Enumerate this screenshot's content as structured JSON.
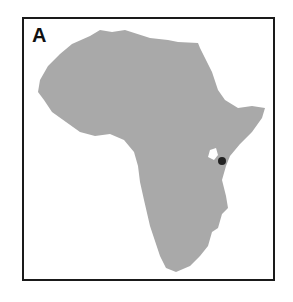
{
  "panel": {
    "label": "A"
  },
  "map": {
    "region": "Africa",
    "land_color": "#a9a9a9",
    "frame_color": "#1a1a1a",
    "marker": {
      "color": "#222222",
      "description": "location marker near Lake Victoria, East Africa"
    }
  }
}
